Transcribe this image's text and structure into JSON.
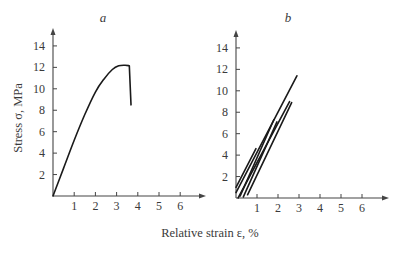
{
  "figure": {
    "ylabel": "Stress σ, MPa",
    "xlabel": "Relative strain ε, %"
  },
  "chart_data": [
    {
      "type": "line",
      "panel_label": "a",
      "title": "a",
      "xlabel": "Relative strain ε, %",
      "ylabel": "Stress σ, MPa",
      "x_ticks": [
        1,
        2,
        3,
        4,
        5,
        6
      ],
      "y_ticks": [
        2,
        4,
        6,
        8,
        10,
        12,
        14
      ],
      "xlim": [
        0,
        7
      ],
      "ylim": [
        0,
        15
      ],
      "grid": false,
      "series": [
        {
          "name": "stress-strain curve",
          "x": [
            0.0,
            0.5,
            1.0,
            1.5,
            2.0,
            2.4,
            2.8,
            3.1,
            3.4,
            3.6,
            3.68
          ],
          "y": [
            0.0,
            2.6,
            5.2,
            7.6,
            9.7,
            10.9,
            11.8,
            12.15,
            12.2,
            12.15,
            8.5
          ]
        }
      ]
    },
    {
      "type": "line",
      "panel_label": "b",
      "title": "b",
      "xlabel": "Relative strain ε, %",
      "ylabel": "Stress σ, MPa",
      "x_ticks": [
        1,
        2,
        3,
        4,
        5,
        6
      ],
      "y_ticks": [
        2,
        4,
        6,
        8,
        10,
        12,
        14
      ],
      "xlim": [
        0,
        7
      ],
      "ylim": [
        0,
        15
      ],
      "grid": false,
      "series": [
        {
          "name": "loading line 1",
          "x": [
            0.0,
            2.9
          ],
          "y": [
            0.5,
            11.4
          ]
        },
        {
          "name": "loading line 2",
          "x": [
            0.1,
            2.55
          ],
          "y": [
            0.0,
            9.0
          ]
        },
        {
          "name": "loading line 3",
          "x": [
            0.2,
            1.8
          ],
          "y": [
            0.2,
            7.3
          ]
        },
        {
          "name": "loading line 4",
          "x": [
            0.35,
            1.95
          ],
          "y": [
            0.1,
            7.1
          ]
        },
        {
          "name": "loading line 5",
          "x": [
            0.55,
            2.65
          ],
          "y": [
            0.3,
            8.9
          ]
        },
        {
          "name": "loading line 6",
          "x": [
            0.0,
            0.95
          ],
          "y": [
            1.0,
            4.6
          ]
        }
      ]
    }
  ],
  "layout": {
    "panels": [
      {
        "x0": 53,
        "y0": 196,
        "sx": 21.2,
        "sy": 10.72,
        "axis_x_end": 206,
        "axis_y_top": 28,
        "label_x": 103,
        "label_y": 22
      },
      {
        "x0": 236,
        "y0": 198,
        "sx": 21.0,
        "sy": 10.72,
        "axis_x_end": 389,
        "axis_y_top": 30,
        "label_x": 288,
        "label_y": 22
      }
    ]
  }
}
